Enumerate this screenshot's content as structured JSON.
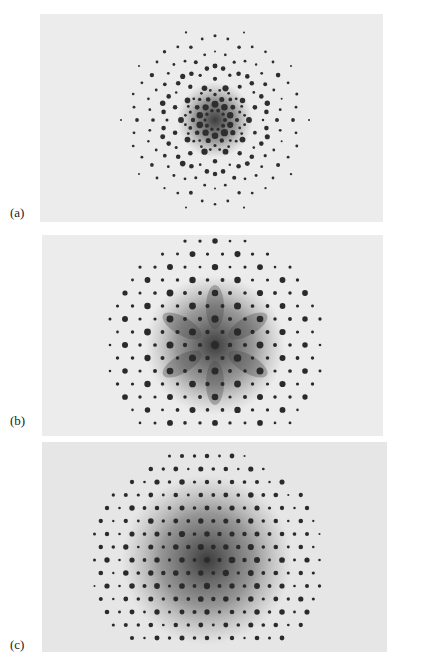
{
  "figure": {
    "panels": [
      {
        "id": "a",
        "label": "(a)",
        "description": "ten-fold symmetric diffraction pattern (quasicrystal), concentric rings of sharp spots with dark diffuse center",
        "box": {
          "left": 40,
          "top": 14,
          "width": 343,
          "height": 208
        },
        "center": {
          "x": 175,
          "y": 106
        },
        "symmetry": 10,
        "style": "quasi",
        "spot_color": "#2e2e2e",
        "bg_color": "#ececec",
        "halo_radius": 38,
        "label_pos": {
          "left": 10,
          "top": 205
        }
      },
      {
        "id": "b",
        "label": "(b)",
        "description": "six-fold symmetric diffraction pattern, hexagonal lattice of spots with star-shaped dark diffuse center",
        "box": {
          "left": 42,
          "top": 235,
          "width": 341,
          "height": 201
        },
        "center": {
          "x": 173,
          "y": 110
        },
        "symmetry": 6,
        "style": "hex",
        "spot_color": "#2a2a2a",
        "bg_color": "#ececec",
        "halo_radius": 70,
        "label_pos": {
          "left": 10,
          "top": 413
        }
      },
      {
        "id": "c",
        "label": "(c)",
        "description": "dense periodic diffraction pattern, rectangular lattice of spots with large dark diffuse circular center",
        "box": {
          "left": 42,
          "top": 442,
          "width": 345,
          "height": 210
        },
        "center": {
          "x": 165,
          "y": 118
        },
        "symmetry": 4,
        "style": "rect",
        "spot_color": "#2c2c2c",
        "bg_color": "#e6e6e6",
        "halo_radius": 85,
        "label_pos": {
          "left": 10,
          "top": 637
        }
      }
    ]
  }
}
